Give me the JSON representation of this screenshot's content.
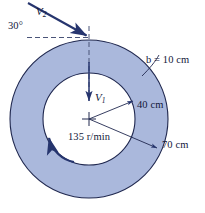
{
  "figure": {
    "labels": {
      "inlet_angle": "30°",
      "v2_symbol": "V",
      "v2_subscript": "2",
      "blade_width": "b = 10 cm",
      "v1_symbol": "V",
      "v1_subscript": "1",
      "inner_radius": "40 cm",
      "outer_radius": "70 cm",
      "rotation_speed": "135 r/min"
    },
    "colors": {
      "annulus_fill": "#aab8dc",
      "outline": "#20284f",
      "arrow": "#26356e",
      "dashed": "#4a5478",
      "text": "#13183a",
      "background": "#ffffff"
    },
    "geometry": {
      "center_x": 89,
      "center_y": 119,
      "outer_radius_px": 79,
      "inner_radius_px": 46
    }
  }
}
